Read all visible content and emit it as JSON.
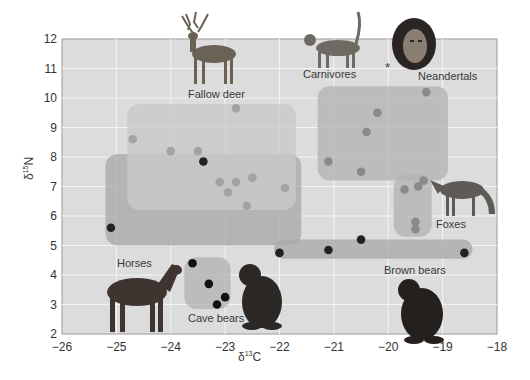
{
  "chart_data": {
    "type": "scatter",
    "title": "",
    "xlabel": "δ13C",
    "ylabel": "δ15N",
    "xlim": [
      -26,
      -18
    ],
    "ylim": [
      2,
      12
    ],
    "x_ticks": [
      -26,
      -25,
      -24,
      -23,
      -22,
      -21,
      -20,
      -19,
      -18
    ],
    "y_ticks": [
      2,
      3,
      4,
      5,
      6,
      7,
      8,
      9,
      10,
      11,
      12
    ],
    "grid": true,
    "regions": [
      {
        "name": "Horses / Brown bears (herbivore-omnivore zone)",
        "x": [
          -25.2,
          -21.6
        ],
        "y": [
          5.0,
          8.1
        ],
        "shade": "#a9a9a9"
      },
      {
        "name": "Brown bears band",
        "x": [
          -22.1,
          -18.45
        ],
        "y": [
          4.55,
          5.2
        ],
        "shade": "#a9a9a9"
      },
      {
        "name": "Fallow deer",
        "x": [
          -24.8,
          -21.7
        ],
        "y": [
          6.2,
          9.8
        ],
        "shade": "#c9c9c9"
      },
      {
        "name": "Carnivores",
        "x": [
          -21.3,
          -18.9
        ],
        "y": [
          7.2,
          10.4
        ],
        "shade": "#b3b3b3"
      },
      {
        "name": "Foxes",
        "x": [
          -19.9,
          -19.2
        ],
        "y": [
          5.3,
          7.4
        ],
        "shade": "#b3b3b3"
      },
      {
        "name": "Cave bears",
        "x": [
          -23.75,
          -22.9
        ],
        "y": [
          2.85,
          4.6
        ],
        "shade": "#b3b3b3"
      }
    ],
    "series": [
      {
        "name": "Horses / Brown bears",
        "color": "#222222",
        "points": [
          [
            -25.1,
            5.6
          ],
          [
            -23.4,
            7.85
          ],
          [
            -22.0,
            4.75
          ],
          [
            -21.1,
            4.85
          ],
          [
            -20.5,
            5.2
          ],
          [
            -18.6,
            4.75
          ]
        ]
      },
      {
        "name": "Cave bears",
        "color": "#111111",
        "points": [
          [
            -23.6,
            4.4
          ],
          [
            -23.3,
            3.7
          ],
          [
            -23.0,
            3.25
          ],
          [
            -23.15,
            3.0
          ]
        ]
      },
      {
        "name": "Fallow deer",
        "color": "#a3a3a3",
        "points": [
          [
            -24.7,
            8.6
          ],
          [
            -24.0,
            8.2
          ],
          [
            -23.5,
            8.2
          ],
          [
            -23.1,
            7.15
          ],
          [
            -22.8,
            7.15
          ],
          [
            -22.95,
            6.8
          ],
          [
            -22.5,
            7.3
          ],
          [
            -22.6,
            6.35
          ],
          [
            -21.9,
            6.95
          ],
          [
            -22.8,
            9.65
          ]
        ]
      },
      {
        "name": "Carnivores",
        "color": "#8a8a8a",
        "points": [
          [
            -19.3,
            10.2
          ],
          [
            -20.2,
            9.5
          ],
          [
            -20.4,
            8.85
          ],
          [
            -21.1,
            7.85
          ],
          [
            -20.5,
            7.5
          ]
        ]
      },
      {
        "name": "Foxes",
        "color": "#8a8a8a",
        "points": [
          [
            -19.7,
            6.9
          ],
          [
            -19.45,
            7.0
          ],
          [
            -19.35,
            7.2
          ],
          [
            -19.5,
            5.8
          ],
          [
            -19.5,
            5.55
          ]
        ]
      }
    ],
    "annotations": [
      {
        "text": "Fallow deer",
        "x": -23.3,
        "y": 10.1
      },
      {
        "text": "Carnivores",
        "x": -21.6,
        "y": 10.9
      },
      {
        "text": "Neandertals",
        "x": -19.35,
        "y": 10.75
      },
      {
        "text": "*",
        "x": -20.0,
        "y": 11.1
      },
      {
        "text": "Foxes",
        "x": -19.1,
        "y": 5.9
      },
      {
        "text": "Horses",
        "x": -24.5,
        "y": 4.4
      },
      {
        "text": "Cave bears",
        "x": -23.05,
        "y": 2.6
      },
      {
        "text": "Brown bears",
        "x": -19.5,
        "y": 4.25
      }
    ]
  },
  "labels": {
    "fallow_deer": "Fallow deer",
    "carnivores": "Carnivores",
    "neandertals": "Neandertals",
    "asterisk": "*",
    "foxes": "Foxes",
    "horses": "Horses",
    "cave_bears": "Cave bears",
    "brown_bears": "Brown bears"
  },
  "axes": {
    "xlabel_main": "δ",
    "xlabel_sup": "13",
    "xlabel_tail": "C",
    "ylabel_main": "δ",
    "ylabel_sup": "15",
    "ylabel_tail": "N"
  }
}
